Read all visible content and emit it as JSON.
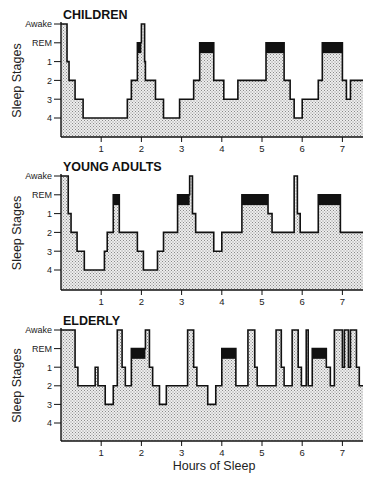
{
  "figure": {
    "x_axis_label": "Hours of Sleep",
    "y_axis_label": "Sleep Stages",
    "colors": {
      "fill_dots": "#bdbdbd",
      "fill_bg": "#ececec",
      "rem": "#111111",
      "line": "#111111"
    }
  },
  "chart_data": [
    {
      "type": "line",
      "subtype": "step-area (hypnogram)",
      "title": "CHILDREN",
      "xlabel": "",
      "ylabel": "Sleep Stages",
      "y_categories": [
        "Awake",
        "REM",
        "1",
        "2",
        "3",
        "4"
      ],
      "x_ticks": [
        1,
        2,
        3,
        4,
        5,
        6,
        7
      ],
      "xlim": [
        0,
        7.5
      ],
      "grid": false,
      "steps": [
        [
          0.0,
          "Awake"
        ],
        [
          0.15,
          "1"
        ],
        [
          0.2,
          "2"
        ],
        [
          0.35,
          "3"
        ],
        [
          0.55,
          "4"
        ],
        [
          1.65,
          "3"
        ],
        [
          1.75,
          "2"
        ],
        [
          1.9,
          "REM"
        ],
        [
          2.0,
          "Awake"
        ],
        [
          2.08,
          "1"
        ],
        [
          2.1,
          "2"
        ],
        [
          2.35,
          "3"
        ],
        [
          2.55,
          "4"
        ],
        [
          2.95,
          "3"
        ],
        [
          3.3,
          "2"
        ],
        [
          3.45,
          "REM"
        ],
        [
          3.8,
          "2"
        ],
        [
          4.05,
          "3"
        ],
        [
          4.4,
          "2"
        ],
        [
          5.1,
          "REM"
        ],
        [
          5.55,
          "2"
        ],
        [
          5.7,
          "3"
        ],
        [
          5.8,
          "4"
        ],
        [
          6.0,
          "3"
        ],
        [
          6.4,
          "2"
        ],
        [
          6.5,
          "REM"
        ],
        [
          7.0,
          "2"
        ],
        [
          7.1,
          "3"
        ],
        [
          7.2,
          "2"
        ],
        [
          7.5,
          "2"
        ]
      ]
    },
    {
      "type": "line",
      "subtype": "step-area (hypnogram)",
      "title": "YOUNG ADULTS",
      "xlabel": "",
      "ylabel": "Sleep Stages",
      "y_categories": [
        "Awake",
        "REM",
        "1",
        "2",
        "3",
        "4"
      ],
      "x_ticks": [
        1,
        2,
        3,
        4,
        5,
        6,
        7
      ],
      "xlim": [
        0,
        7.5
      ],
      "grid": false,
      "steps": [
        [
          0.0,
          "Awake"
        ],
        [
          0.18,
          "1"
        ],
        [
          0.25,
          "2"
        ],
        [
          0.4,
          "3"
        ],
        [
          0.58,
          "4"
        ],
        [
          1.08,
          "3"
        ],
        [
          1.15,
          "2"
        ],
        [
          1.3,
          "REM"
        ],
        [
          1.45,
          "2"
        ],
        [
          1.9,
          "3"
        ],
        [
          2.05,
          "4"
        ],
        [
          2.4,
          "3"
        ],
        [
          2.55,
          "2"
        ],
        [
          2.9,
          "REM"
        ],
        [
          3.2,
          "Awake"
        ],
        [
          3.27,
          "1"
        ],
        [
          3.35,
          "2"
        ],
        [
          3.8,
          "3"
        ],
        [
          4.0,
          "2"
        ],
        [
          4.5,
          "REM"
        ],
        [
          5.15,
          "1"
        ],
        [
          5.25,
          "2"
        ],
        [
          5.8,
          "Awake"
        ],
        [
          5.88,
          "1"
        ],
        [
          5.95,
          "2"
        ],
        [
          6.4,
          "REM"
        ],
        [
          6.95,
          "2"
        ],
        [
          7.5,
          "2"
        ]
      ]
    },
    {
      "type": "line",
      "subtype": "step-area (hypnogram)",
      "title": "ELDERLY",
      "xlabel": "Hours of Sleep",
      "ylabel": "Sleep Stages",
      "y_categories": [
        "Awake",
        "REM",
        "1",
        "2",
        "3",
        "4"
      ],
      "x_ticks": [
        1,
        2,
        3,
        4,
        5,
        6,
        7
      ],
      "xlim": [
        0,
        7.5
      ],
      "grid": false,
      "steps": [
        [
          0.0,
          "Awake"
        ],
        [
          0.35,
          "1"
        ],
        [
          0.42,
          "2"
        ],
        [
          0.85,
          "1"
        ],
        [
          0.92,
          "2"
        ],
        [
          1.1,
          "3"
        ],
        [
          1.3,
          "2"
        ],
        [
          1.4,
          "Awake"
        ],
        [
          1.52,
          "1"
        ],
        [
          1.6,
          "2"
        ],
        [
          1.75,
          "REM"
        ],
        [
          2.1,
          "Awake"
        ],
        [
          2.2,
          "1"
        ],
        [
          2.28,
          "2"
        ],
        [
          2.45,
          "3"
        ],
        [
          2.62,
          "2"
        ],
        [
          3.15,
          "Awake"
        ],
        [
          3.3,
          "1"
        ],
        [
          3.38,
          "2"
        ],
        [
          3.65,
          "3"
        ],
        [
          3.85,
          "2"
        ],
        [
          4.0,
          "REM"
        ],
        [
          4.35,
          "2"
        ],
        [
          4.65,
          "Awake"
        ],
        [
          4.82,
          "1"
        ],
        [
          4.88,
          "2"
        ],
        [
          5.35,
          "Awake"
        ],
        [
          5.48,
          "1"
        ],
        [
          5.55,
          "2"
        ],
        [
          5.75,
          "Awake"
        ],
        [
          5.9,
          "1"
        ],
        [
          5.98,
          "2"
        ],
        [
          6.1,
          "Awake"
        ],
        [
          6.15,
          "2"
        ],
        [
          6.25,
          "REM"
        ],
        [
          6.6,
          "1"
        ],
        [
          6.7,
          "2"
        ],
        [
          6.8,
          "Awake"
        ],
        [
          7.0,
          "1"
        ],
        [
          7.05,
          "Awake"
        ],
        [
          7.15,
          "1"
        ],
        [
          7.2,
          "Awake"
        ],
        [
          7.35,
          "1"
        ],
        [
          7.42,
          "2"
        ],
        [
          7.5,
          "2"
        ]
      ]
    }
  ]
}
